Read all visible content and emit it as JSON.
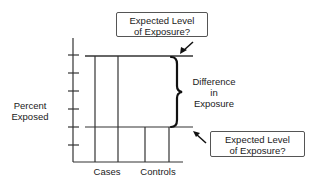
{
  "diagram": {
    "y_axis_label_line1": "Percent",
    "y_axis_label_line2": "Exposed",
    "x_labels": {
      "cases": "Cases",
      "controls": "Controls"
    },
    "difference_label": {
      "line1": "Difference",
      "line2": "in",
      "line3": "Exposure"
    },
    "callout_top": {
      "line1": "Expected Level",
      "line2": "of Exposure?"
    },
    "callout_bottom": {
      "line1": "Expected Level",
      "line2": "of Exposure?"
    },
    "colors": {
      "line": "#333333",
      "text": "#1a1a1a",
      "background": "#ffffff"
    }
  }
}
